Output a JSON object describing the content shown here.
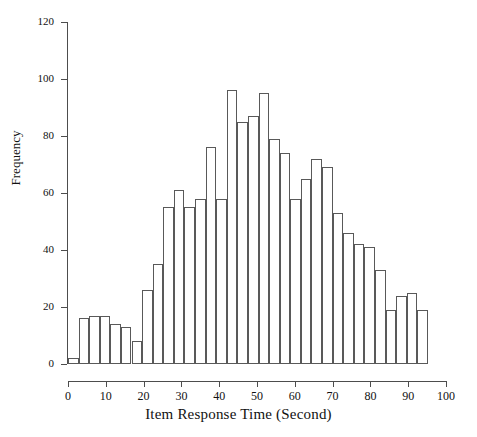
{
  "chart_data": {
    "type": "bar",
    "title": "",
    "subtitle": "",
    "xlabel": "Item Response Time (Second)",
    "ylabel": "Frequency",
    "xlim": [
      0,
      100
    ],
    "ylim": [
      0,
      120
    ],
    "grid": false,
    "legend": null,
    "bin_width": 2.8,
    "x_ticks": [
      0,
      10,
      20,
      30,
      40,
      50,
      60,
      70,
      80,
      90,
      100
    ],
    "x_tick_labels": [
      "0",
      "10",
      "20",
      "30",
      "40",
      "50",
      "60",
      "70",
      "80",
      "90",
      "100"
    ],
    "y_ticks": [
      0,
      20,
      40,
      60,
      80,
      100,
      120
    ],
    "y_tick_labels": [
      "0",
      "20",
      "40",
      "60",
      "80",
      "100",
      "120"
    ],
    "bin_starts": [
      0,
      2.8,
      5.6,
      8.4,
      11.2,
      14.0,
      16.8,
      19.6,
      22.4,
      25.2,
      28.0,
      30.8,
      33.6,
      36.4,
      39.2,
      42.0,
      44.8,
      47.6,
      50.4,
      53.2,
      56.0,
      58.8,
      61.6,
      64.4,
      67.2,
      70.0,
      72.8,
      75.6,
      78.4,
      81.2,
      84.0,
      86.8,
      89.6,
      92.4
    ],
    "values": [
      2,
      16,
      17,
      17,
      14,
      13,
      8,
      26,
      35,
      55,
      61,
      55,
      58,
      76,
      58,
      96,
      85,
      87,
      95,
      79,
      74,
      58,
      65,
      72,
      69,
      53,
      46,
      42,
      41,
      33,
      19,
      24,
      25,
      19
    ],
    "categories": [
      "0-2.8",
      "2.8-5.6",
      "5.6-8.4",
      "8.4-11.2",
      "11.2-14",
      "14-16.8",
      "16.8-19.6",
      "19.6-22.4",
      "22.4-25.2",
      "25.2-28",
      "28-30.8",
      "30.8-33.6",
      "33.6-36.4",
      "36.4-39.2",
      "39.2-42",
      "42-44.8",
      "44.8-47.6",
      "47.6-50.4",
      "50.4-53.2",
      "53.2-56",
      "56-58.8",
      "58.8-61.6",
      "61.6-64.4",
      "64.4-67.2",
      "67.2-70",
      "70-72.8",
      "72.8-75.6",
      "75.6-78.4",
      "78.4-81.2",
      "81.2-84",
      "84-86.8",
      "86.8-89.6",
      "89.6-92.4",
      "92.4-95.2"
    ],
    "colors": {
      "bar_fill": "#ffffff",
      "bar_edge": "#595959",
      "axis": "#4d4d4d",
      "text": "#111111",
      "background": "#ffffff"
    }
  }
}
